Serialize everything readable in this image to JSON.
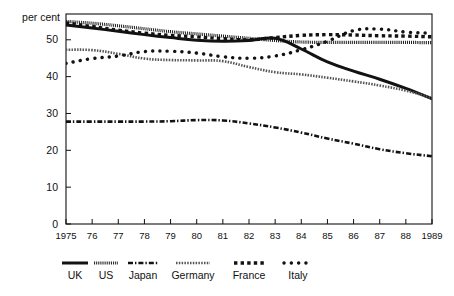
{
  "chart_data": {
    "type": "line",
    "title": "",
    "subtitle": "",
    "xlabel": "",
    "ylabel": "per cent",
    "unit_label": "per cent",
    "grid": false,
    "legend_position": "bottom",
    "x": [
      1975,
      1976,
      1977,
      1978,
      1979,
      1980,
      1981,
      1982,
      1983,
      1984,
      1985,
      1986,
      1987,
      1988,
      1989
    ],
    "x_tick_labels": [
      "1975",
      "76",
      "77",
      "78",
      "79",
      "80",
      "81",
      "82",
      "83",
      "84",
      "85",
      "86",
      "87",
      "88",
      "1989"
    ],
    "y_tick_labels": [
      "0",
      "10",
      "20",
      "30",
      "40",
      "50"
    ],
    "y_ticks": [
      0,
      10,
      20,
      30,
      40,
      50
    ],
    "xlim": [
      1975,
      1989
    ],
    "ylim": [
      0,
      57
    ],
    "series": [
      {
        "name": "UK",
        "style": "solid-bold",
        "color": "#121212",
        "values": [
          54.0,
          53.2,
          52.3,
          51.4,
          50.6,
          49.9,
          49.6,
          49.8,
          50.4,
          47.5,
          44.0,
          41.5,
          39.3,
          36.8,
          34.0
        ]
      },
      {
        "name": "US",
        "style": "fine-hatch",
        "color": "#121212",
        "values": [
          55.0,
          54.5,
          53.8,
          53.0,
          52.2,
          51.6,
          51.0,
          50.4,
          49.8,
          49.4,
          49.3,
          49.3,
          49.3,
          49.3,
          49.2
        ]
      },
      {
        "name": "Japan",
        "style": "dash-dot",
        "color": "#121212",
        "values": [
          27.8,
          27.8,
          27.8,
          27.8,
          27.9,
          28.2,
          28.1,
          27.3,
          26.2,
          24.8,
          23.2,
          21.8,
          20.3,
          19.2,
          18.4
        ]
      },
      {
        "name": "Germany",
        "style": "fine-dot",
        "color": "#555555",
        "values": [
          47.3,
          47.2,
          46.2,
          44.9,
          44.5,
          44.4,
          44.2,
          42.6,
          41.2,
          40.6,
          39.7,
          38.7,
          37.6,
          36.2,
          34.2
        ]
      },
      {
        "name": "France",
        "style": "square-dot",
        "color": "#121212",
        "values": [
          54.6,
          53.6,
          52.6,
          51.8,
          51.2,
          50.8,
          50.3,
          50.0,
          50.6,
          51.2,
          51.4,
          51.3,
          51.1,
          51.0,
          50.8
        ]
      },
      {
        "name": "Italy",
        "style": "round-dot",
        "color": "#121212",
        "values": [
          43.6,
          44.9,
          45.6,
          46.8,
          46.9,
          46.4,
          45.4,
          45.0,
          45.6,
          47.3,
          49.6,
          52.5,
          52.9,
          52.1,
          51.8
        ]
      }
    ],
    "legend": [
      {
        "name": "UK",
        "style": "solid-bold"
      },
      {
        "name": "US",
        "style": "fine-hatch"
      },
      {
        "name": "Japan",
        "style": "dash-dot"
      },
      {
        "name": "Germany",
        "style": "fine-dot"
      },
      {
        "name": "France",
        "style": "square-dot"
      },
      {
        "name": "Italy",
        "style": "round-dot"
      }
    ],
    "colors": {
      "ink": "#121212",
      "germany": "#555555",
      "background": "#ffffff",
      "frame": "#111111"
    }
  }
}
